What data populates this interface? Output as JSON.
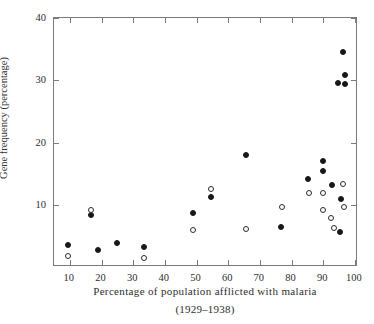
{
  "chart_data": {
    "type": "scatter",
    "title": "",
    "xlabel": "Percentage of population afflicted with malaria",
    "xsublabel": "(1929–1938)",
    "ylabel": "Gene frequency (percentage)",
    "xlim": [
      5,
      101
    ],
    "ylim": [
      0,
      40
    ],
    "xticks": [
      10,
      20,
      30,
      40,
      50,
      60,
      70,
      80,
      90,
      100
    ],
    "yticks": [
      10,
      20,
      30,
      40
    ],
    "grid": false,
    "legend": "none",
    "ticks_all_sides": true,
    "colors": {
      "filled": "#171717",
      "open": "#2c2c2c",
      "frame": "#7b7b7b",
      "text": "#2e2e2e",
      "background": "#ffffff"
    },
    "series": [
      {
        "name": "filled",
        "marker": "filled-circle",
        "points": [
          [
            9.5,
            3.6
          ],
          [
            16.8,
            8.3
          ],
          [
            18.8,
            2.7
          ],
          [
            24.8,
            3.8
          ],
          [
            33.3,
            3.2
          ],
          [
            49.0,
            8.6
          ],
          [
            54.5,
            11.2
          ],
          [
            65.5,
            18.0
          ],
          [
            76.8,
            6.5
          ],
          [
            85.3,
            14.2
          ],
          [
            89.8,
            17.0
          ],
          [
            89.8,
            15.5
          ],
          [
            92.8,
            13.2
          ],
          [
            94.8,
            29.5
          ],
          [
            95.5,
            11.0
          ],
          [
            95.2,
            5.6
          ],
          [
            96.3,
            34.6
          ],
          [
            97.0,
            30.8
          ],
          [
            97.0,
            29.4
          ]
        ]
      },
      {
        "name": "open",
        "marker": "open-circle",
        "points": [
          [
            9.5,
            1.7
          ],
          [
            16.8,
            9.2
          ],
          [
            33.3,
            1.5
          ],
          [
            49.0,
            6.0
          ],
          [
            54.5,
            12.5
          ],
          [
            65.5,
            6.1
          ],
          [
            77.0,
            9.6
          ],
          [
            85.5,
            11.9
          ],
          [
            89.8,
            11.9
          ],
          [
            89.8,
            9.2
          ],
          [
            92.5,
            7.9
          ],
          [
            93.5,
            6.3
          ],
          [
            96.3,
            13.3
          ],
          [
            96.5,
            9.6
          ]
        ]
      }
    ]
  }
}
